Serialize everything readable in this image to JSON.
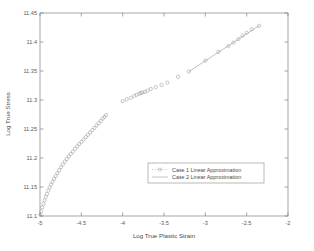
{
  "chart_data": {
    "type": "scatter",
    "title": "",
    "xlabel": "Log True Plastic Strain",
    "ylabel": "Log True Stress",
    "xlim": [
      -5,
      -2
    ],
    "ylim": [
      11.1,
      11.45
    ],
    "xticks": [
      -5,
      -4.5,
      -4,
      -3.5,
      -3,
      -2.5,
      -2
    ],
    "xticklabels": [
      "-5",
      "-4.5",
      "-4",
      "-3.5",
      "-3",
      "-2.5",
      "-2"
    ],
    "yticks": [
      11.1,
      11.15,
      11.2,
      11.25,
      11.3,
      11.35,
      11.4,
      11.45
    ],
    "yticklabels": [
      "11.1",
      "11.15",
      "11.2",
      "11.25",
      "11.3",
      "11.35",
      "11.4",
      "11.45"
    ],
    "grid": false,
    "legend_position": "center-right",
    "series": [
      {
        "name": "Case 1 Linear Approximation",
        "marker": "circle",
        "linestyle": "dotted",
        "color": "#9a9a9a",
        "x": [
          -4.995,
          -4.985,
          -4.972,
          -4.958,
          -4.944,
          -4.93,
          -4.916,
          -4.9,
          -4.884,
          -4.866,
          -4.848,
          -4.83,
          -4.81,
          -4.79,
          -4.768,
          -4.746,
          -4.724,
          -4.7,
          -4.676,
          -4.652,
          -4.628,
          -4.602,
          -4.576,
          -4.55,
          -4.524,
          -4.498,
          -4.472,
          -4.446,
          -4.42,
          -4.394,
          -4.368,
          -4.342,
          -4.316,
          -4.29,
          -4.266,
          -4.242,
          -4.22,
          -4.2,
          -4.0,
          -3.95,
          -3.9,
          -3.86,
          -3.83,
          -3.8,
          -3.78,
          -3.76,
          -3.73,
          -3.7,
          -3.66,
          -3.6,
          -3.53,
          -3.46,
          -3.33,
          -3.2,
          -3.0,
          -2.84,
          -2.72,
          -2.66,
          -2.6,
          -2.55,
          -2.5,
          -2.44,
          -2.35
        ],
        "y": [
          11.102,
          11.108,
          11.115,
          11.121,
          11.127,
          11.133,
          11.138,
          11.144,
          11.149,
          11.154,
          11.159,
          11.164,
          11.169,
          11.174,
          11.179,
          11.184,
          11.189,
          11.194,
          11.198,
          11.203,
          11.207,
          11.211,
          11.216,
          11.22,
          11.224,
          11.228,
          11.232,
          11.236,
          11.24,
          11.244,
          11.248,
          11.252,
          11.256,
          11.26,
          11.264,
          11.268,
          11.271,
          11.274,
          11.298,
          11.301,
          11.304,
          11.307,
          11.309,
          11.311,
          11.312,
          11.313,
          11.314,
          11.316,
          11.319,
          11.322,
          11.326,
          11.33,
          11.34,
          11.349,
          11.368,
          11.383,
          11.393,
          11.399,
          11.405,
          11.411,
          11.416,
          11.422,
          11.428
        ]
      },
      {
        "name": "Case 2 Linear Approximation",
        "marker": "none",
        "linestyle": "solid",
        "color": "#8e8e8e",
        "x": [
          -3.2,
          -2.35
        ],
        "y": [
          11.349,
          11.428
        ]
      }
    ],
    "legend": [
      {
        "label": "Case 1 Linear Approximation",
        "style": "dotted-marker"
      },
      {
        "label": "Case 2 Linear Approximation",
        "style": "solid"
      }
    ]
  },
  "figure": {
    "background_color": "#ffffff",
    "axis_color": "#808080"
  }
}
